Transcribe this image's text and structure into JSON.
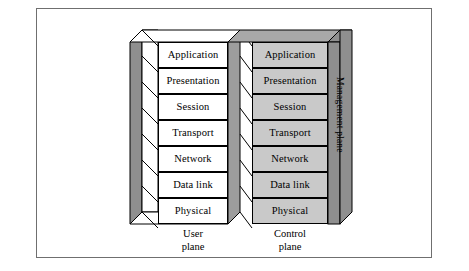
{
  "figure": {
    "colors": {
      "user_plane_fill": "#ffffff",
      "control_plane_fill": "#c9c9c9",
      "management_plane_fill": "#8f8f8f",
      "side_face_fill": "#8f8f8f",
      "top_face_fill": "#a8a8a8",
      "stroke": "#000000",
      "frame_stroke": "#6f6f6f",
      "background": "#ffffff"
    }
  },
  "layers": [
    {
      "name": "Application"
    },
    {
      "name": "Presentation"
    },
    {
      "name": "Session"
    },
    {
      "name": "Transport"
    },
    {
      "name": "Network"
    },
    {
      "name": "Data link"
    },
    {
      "name": "Physical"
    }
  ],
  "planes": {
    "user": {
      "caption_line1": "User",
      "caption_line2": "plane",
      "layers": [
        "Application",
        "Presentation",
        "Session",
        "Transport",
        "Network",
        "Data link",
        "Physical"
      ]
    },
    "control": {
      "caption_line1": "Control",
      "caption_line2": "plane",
      "layers": [
        "Application",
        "Presentation",
        "Session",
        "Transport",
        "Network",
        "Data link",
        "Physical"
      ]
    },
    "management": {
      "label": "Management plane"
    }
  }
}
